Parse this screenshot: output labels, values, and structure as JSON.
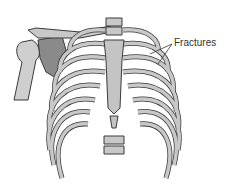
{
  "figure": {
    "annotation": "Fractures",
    "colors": {
      "bone_fill": "#c8c8c8",
      "bone_outline": "#3a3a3a",
      "dark_bone": "#8a8a8a",
      "background": "#ffffff",
      "text": "#333333"
    }
  }
}
